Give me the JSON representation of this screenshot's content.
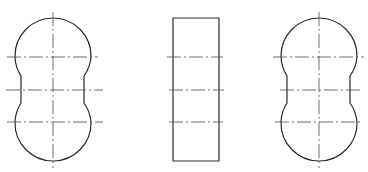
{
  "drawing": {
    "type": "orthographic-views",
    "line_color": "#2a2a2a",
    "centerline_color": "#4a4a4a",
    "background": "#ffffff",
    "views": [
      {
        "name": "left-view",
        "shape": "double-lobe profile",
        "center_x": 53,
        "top_y": 18,
        "bottom_y": 161,
        "lobe_radius": 38,
        "lobe_centers_y": [
          57,
          122
        ],
        "waist_x": [
          21,
          84
        ],
        "waist_y": [
          76,
          103
        ],
        "centerlines": {
          "vertical": {
            "x": 53,
            "y1": 12,
            "y2": 168
          },
          "horizontal": [
            {
              "y": 57,
              "x1": 7,
              "x2": 98
            },
            {
              "y": 90,
              "x1": 6,
              "x2": 103
            },
            {
              "y": 122,
              "x1": 7,
              "x2": 103
            }
          ]
        }
      },
      {
        "name": "middle-view",
        "shape": "rectangle",
        "x": 173,
        "y": 18,
        "width": 46,
        "height": 143,
        "centerlines": {
          "horizontal": [
            {
              "y": 57,
              "x1": 167,
              "x2": 223
            },
            {
              "y": 90,
              "x1": 169,
              "x2": 224
            },
            {
              "y": 122,
              "x1": 169,
              "x2": 223
            }
          ]
        }
      },
      {
        "name": "right-view",
        "shape": "double-lobe profile",
        "center_x": 319,
        "top_y": 18,
        "bottom_y": 161,
        "lobe_radius": 38,
        "lobe_centers_y": [
          57,
          122
        ],
        "waist_x": [
          287,
          350
        ],
        "waist_y": [
          76,
          103
        ],
        "centerlines": {
          "vertical": {
            "x": 319,
            "y1": 12,
            "y2": 168
          },
          "horizontal": [
            {
              "y": 57,
              "x1": 273,
              "x2": 364
            },
            {
              "y": 90,
              "x1": 280,
              "x2": 360
            },
            {
              "y": 122,
              "x1": 275,
              "x2": 362
            }
          ]
        }
      }
    ]
  }
}
